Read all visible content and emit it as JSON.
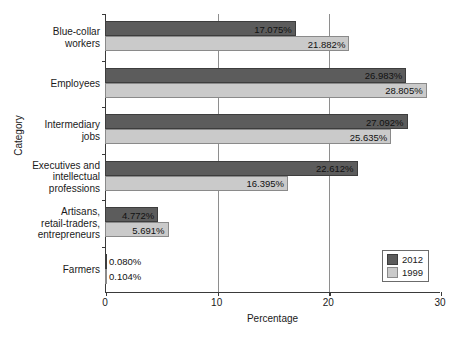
{
  "chart_data": {
    "type": "bar",
    "orientation": "horizontal",
    "title": "",
    "xlabel": "Percentage",
    "ylabel": "Category",
    "xlim": [
      0,
      30
    ],
    "xticks": [
      "0",
      "10",
      "20",
      "30"
    ],
    "grid": "vertical gridlines at 10 and 20",
    "legend_position": "bottom-right inside plot",
    "categories": [
      "Blue-collar workers",
      "Employees",
      "Intermediary jobs",
      "Executives and intellectual professions",
      "Artisans, retail-traders, entrepreneurs",
      "Farmers"
    ],
    "category_label_lines": [
      [
        "Blue-collar",
        "workers"
      ],
      [
        "Employees"
      ],
      [
        "Intermediary",
        "jobs"
      ],
      [
        "Executives and",
        "intellectual",
        "professions"
      ],
      [
        "Artisans,",
        "retail-traders,",
        "entrepreneurs"
      ],
      [
        "Farmers"
      ]
    ],
    "series": [
      {
        "name": "2012",
        "color": "#5c5c5c",
        "values": [
          17.075,
          26.983,
          27.092,
          22.612,
          4.772,
          0.08
        ],
        "labels": [
          "17.075%",
          "26.983%",
          "27.092%",
          "22.612%",
          "4.772%",
          "0.080%"
        ]
      },
      {
        "name": "1999",
        "color": "#cacaca",
        "values": [
          21.882,
          28.805,
          25.635,
          16.395,
          5.691,
          0.104
        ],
        "labels": [
          "21.882%",
          "28.805%",
          "25.635%",
          "16.395%",
          "5.691%",
          "0.104%"
        ]
      }
    ]
  },
  "legend": {
    "entries": [
      {
        "label": "2012",
        "color": "#5c5c5c"
      },
      {
        "label": "1999",
        "color": "#cacaca"
      }
    ]
  }
}
